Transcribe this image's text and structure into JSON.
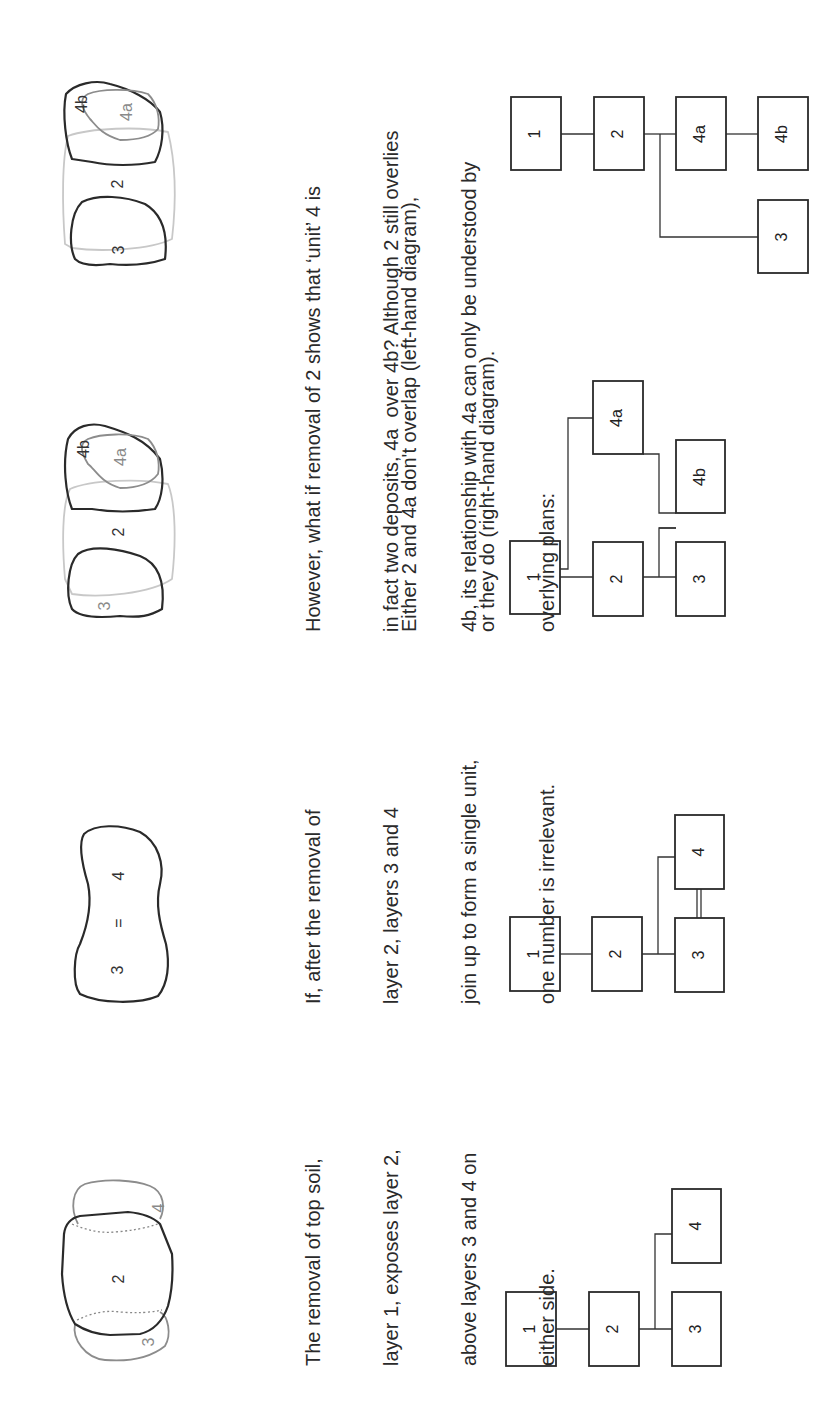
{
  "panels": [
    {
      "id": "step-1",
      "plan_labels": [
        "2",
        "3",
        "4"
      ],
      "caption_lines": [
        "The removal of top soil,",
        "layer 1, exposes layer 2,",
        "above layers 3 and 4 on",
        "either side."
      ],
      "matrix": {
        "boxes": [
          "1",
          "2",
          "3",
          "4"
        ],
        "relations": [
          "1 above 2",
          "2 above 3",
          "2 above 4"
        ]
      }
    },
    {
      "id": "step-2",
      "plan_labels": [
        "3",
        "=",
        "4"
      ],
      "caption_lines": [
        "If, after the removal of",
        "layer 2, layers 3 and 4",
        "join up to form a single unit,",
        "one number is irrelevant."
      ],
      "matrix": {
        "boxes": [
          "1",
          "2",
          "3",
          "4"
        ],
        "relations": [
          "1 above 2",
          "2 above 3",
          "2 above 4",
          "3 equals 4"
        ]
      }
    },
    {
      "id": "step-3",
      "plan_labels": [
        "4b",
        "4a",
        "2",
        "3"
      ],
      "caption_lines": [
        "However, what if removal of 2 shows that ‘unit’ 4 is",
        "in fact two deposits, 4a  over 4b? Although 2 still overlies",
        "4b, its relationship with 4a can only be understood by",
        "overlying plans:"
      ],
      "caption2_lines": [
        "Either 2 and 4a don't overlap (left-hand diagram),",
        "or they do (right-hand diagram)."
      ],
      "matrix": {
        "boxes": [
          "1",
          "2",
          "3",
          "4a",
          "4b"
        ],
        "relations": [
          "1 above 2",
          "1 above 4a",
          "2 above 3",
          "2 above 4b",
          "4a above 4b"
        ]
      }
    },
    {
      "id": "step-4",
      "plan_labels": [
        "4b",
        "4a",
        "2",
        "3"
      ],
      "matrix": {
        "boxes": [
          "1",
          "2",
          "4a",
          "4b",
          "3"
        ],
        "relations": [
          "1 above 2",
          "2 above 4a",
          "2 above 3",
          "4a above 4b"
        ]
      }
    }
  ]
}
